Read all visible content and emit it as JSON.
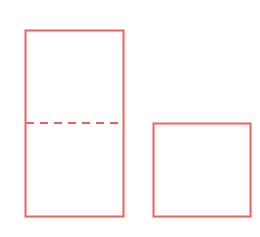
{
  "diagram": {
    "stroke_color": "#f0605a",
    "shapes": [
      {
        "id": "tall-rectangle",
        "x": 25,
        "y": 30,
        "width": 99,
        "height": 187
      },
      {
        "id": "short-rectangle",
        "x": 153,
        "y": 123,
        "width": 98,
        "height": 94
      }
    ],
    "dashed_divider": {
      "x1": 25,
      "y1": 123,
      "x2": 124,
      "y2": 123,
      "dash": "8,6"
    }
  }
}
